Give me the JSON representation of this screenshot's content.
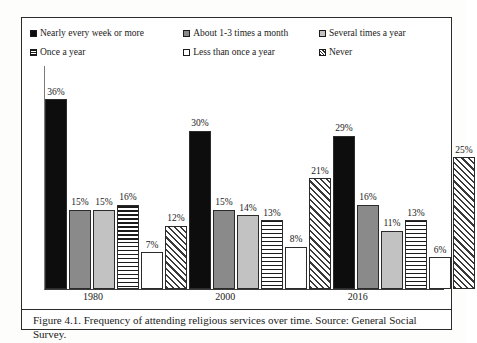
{
  "figure": {
    "caption": "Figure 4.1. Frequency of attending religious services over time. Source: General Social Survey."
  },
  "chart_data": {
    "type": "bar",
    "title": "",
    "xlabel": "",
    "ylabel": "",
    "ylim": [
      0,
      40
    ],
    "grid": false,
    "legend_position": "top",
    "categories": [
      "1980",
      "2000",
      "2016"
    ],
    "series": [
      {
        "name": "Nearly every week or more",
        "pattern": "solid",
        "values": [
          36,
          30,
          29
        ],
        "labels": [
          "36%",
          "30%",
          "29%"
        ]
      },
      {
        "name": "About 1-3 times a month",
        "pattern": "dgray",
        "values": [
          15,
          15,
          16
        ],
        "labels": [
          "15%",
          "15%",
          "16%"
        ]
      },
      {
        "name": "Several times a year",
        "pattern": "lgray",
        "values": [
          15,
          14,
          11
        ],
        "labels": [
          "15%",
          "14%",
          "11%"
        ]
      },
      {
        "name": "Once a year",
        "pattern": "hline",
        "values": [
          16,
          13,
          13
        ],
        "labels": [
          "16%",
          "13%",
          "13%"
        ]
      },
      {
        "name": "Less than once a year",
        "pattern": "white",
        "values": [
          7,
          8,
          6
        ],
        "labels": [
          "7%",
          "8%",
          "6%"
        ]
      },
      {
        "name": "Never",
        "pattern": "hatch",
        "values": [
          12,
          21,
          25
        ],
        "labels": [
          "12%",
          "21%",
          "25%"
        ]
      }
    ]
  },
  "legend": {
    "rows": [
      [
        {
          "label": "Nearly every week or more",
          "pattern": "solid"
        },
        {
          "label": "About 1-3 times a month",
          "pattern": "dgray"
        },
        {
          "label": "Several times a year",
          "pattern": "lgray"
        }
      ],
      [
        {
          "label": "Once a year",
          "pattern": "hline"
        },
        {
          "label": "Less than once a year",
          "pattern": "white"
        },
        {
          "label": "Never",
          "pattern": "hatch"
        }
      ]
    ]
  },
  "colors": {
    "solid": "#0d0d0d",
    "dark_gray": "#8a8a8a",
    "light_gray": "#c2c2c2",
    "outline": "#2b2b2b",
    "background": "#ffffff"
  }
}
